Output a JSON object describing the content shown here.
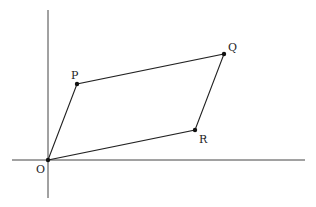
{
  "diagram": {
    "axes": {
      "x_axis": {
        "x1": 12,
        "y1": 160,
        "x2": 305,
        "y2": 160
      },
      "y_axis": {
        "x1": 48,
        "y1": 10,
        "x2": 48,
        "y2": 198
      }
    },
    "points": {
      "O": {
        "label": "O",
        "x": 48,
        "y": 160
      },
      "P": {
        "label": "P",
        "x": 77,
        "y": 84
      },
      "Q": {
        "label": "Q",
        "x": 224,
        "y": 54
      },
      "R": {
        "label": "R",
        "x": 195,
        "y": 130
      }
    },
    "shape": "parallelogram OPQR",
    "colors": {
      "line": "#222222",
      "axis": "#444444"
    }
  }
}
